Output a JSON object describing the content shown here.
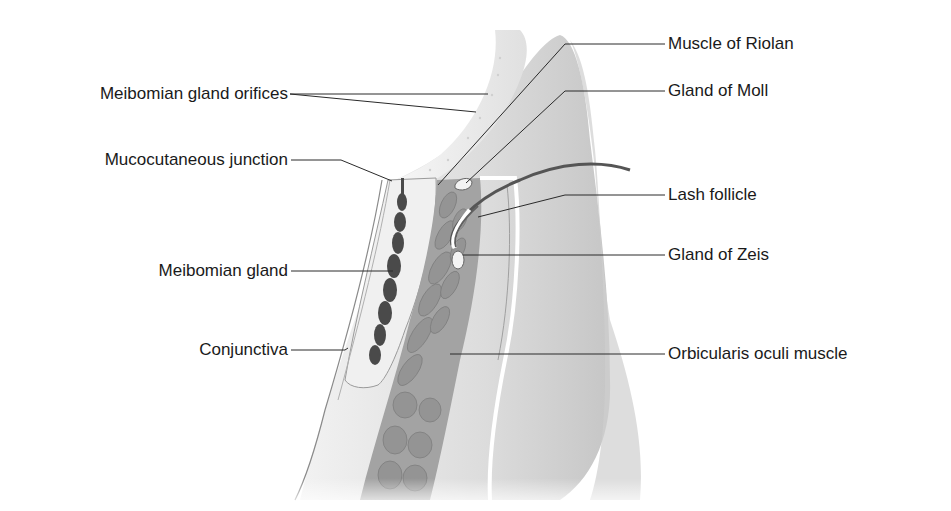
{
  "diagram": {
    "background": "#ffffff",
    "colors": {
      "skin": "#e6e6e6",
      "skin_shadow": "#bdbdbd",
      "muscle": "#9a9a9a",
      "muscle_cell": "#8a8a8a",
      "gland_dark": "#4a4a4a",
      "tarsus": "#efefef",
      "line": "#2a2a2a"
    },
    "labels_left": [
      {
        "id": "meibomian-gland-orifices",
        "text": "Meibomian gland orifices"
      },
      {
        "id": "mucocutaneous-junction",
        "text": "Mucocutaneous junction"
      },
      {
        "id": "meibomian-gland",
        "text": "Meibomian gland"
      },
      {
        "id": "conjunctiva",
        "text": "Conjunctiva"
      }
    ],
    "labels_right": [
      {
        "id": "muscle-of-riolan",
        "text": "Muscle of Riolan"
      },
      {
        "id": "gland-of-moll",
        "text": "Gland of Moll"
      },
      {
        "id": "lash-follicle",
        "text": "Lash follicle"
      },
      {
        "id": "gland-of-zeis",
        "text": "Gland of Zeis"
      },
      {
        "id": "orbicularis-oculi-muscle",
        "text": "Orbicularis oculi muscle"
      }
    ]
  }
}
